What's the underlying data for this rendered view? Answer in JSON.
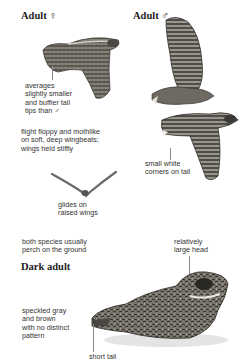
{
  "sections": {
    "adult_female": {
      "heading": "Adult ♀"
    },
    "adult_male": {
      "heading": "Adult ♂"
    },
    "dark_adult": {
      "heading": "Dark adult"
    }
  },
  "captions": {
    "female_tail": [
      "averages",
      "slightly smaller",
      "and buffier tail",
      "tips than ♂"
    ],
    "flight": [
      "flight floppy and mothlike",
      "on soft, deep wingbeats;",
      "wings held stiffly"
    ],
    "male_tail": [
      "small white",
      "corners on tail"
    ],
    "glide": [
      "glides on",
      "raised wings"
    ],
    "perch": [
      "both species usually",
      "perch on the ground"
    ],
    "head": [
      "relatively",
      "large head"
    ],
    "plumage": [
      "speckled gray",
      "and brown",
      "with no distinct",
      "pattern"
    ],
    "short_tail": [
      "short tail"
    ]
  },
  "illustrations": {
    "female_flight": "nightjar-female-flying",
    "male_flight_upper": "nightjar-male-flying-upstroke",
    "male_flight_lower": "nightjar-male-flying-downstroke",
    "glide_silhouette": "gliding-silhouette",
    "perched_dark_adult": "nightjar-perched"
  },
  "colors": {
    "ink": "#2a2a2a",
    "bird_dark": "#3c3a36",
    "bird_mid": "#8a857c",
    "bird_light": "#c9c4ba",
    "leader": "#888888"
  }
}
